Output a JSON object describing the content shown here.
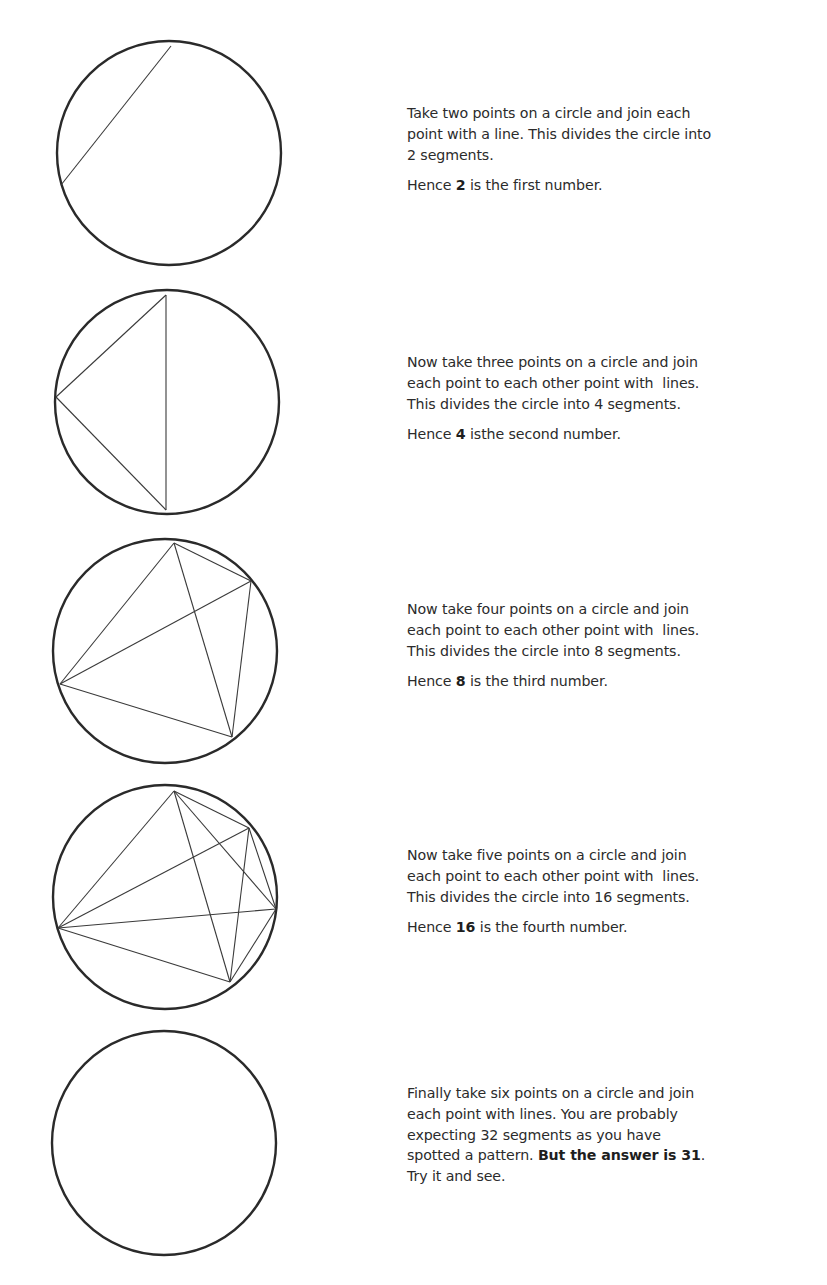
{
  "page": {
    "colors": {
      "text": "#2b2b2b",
      "stroke": "#2a2a2a",
      "background": "#ffffff"
    }
  },
  "figures": [
    {
      "points": 2,
      "segments": 2,
      "circle": {
        "cx": 169,
        "cy": 153,
        "r": 112
      },
      "chord_points": [
        [
          171,
          46
        ],
        [
          61,
          185
        ]
      ],
      "chords": [
        [
          0,
          1
        ]
      ],
      "caption": {
        "lines": [
          "Take two points on a circle and join each",
          "point with a line. This divides the circle into",
          "2 segments."
        ],
        "hence_prefix": "Hence ",
        "hence_number": "2",
        "hence_suffix": " is the first number."
      }
    },
    {
      "points": 3,
      "segments": 4,
      "circle": {
        "cx": 167,
        "cy": 402,
        "r": 112
      },
      "chord_points": [
        [
          166,
          295
        ],
        [
          56,
          397
        ],
        [
          166,
          510
        ]
      ],
      "chords": [
        [
          0,
          1
        ],
        [
          0,
          2
        ],
        [
          1,
          2
        ]
      ],
      "caption": {
        "lines": [
          "Now take three points on a circle and join",
          "each point to each other point with  lines.",
          "This divides the circle into 4 segments."
        ],
        "hence_prefix": "Hence ",
        "hence_number": "4",
        "hence_suffix": " isthe second number."
      }
    },
    {
      "points": 4,
      "segments": 8,
      "circle": {
        "cx": 165,
        "cy": 651,
        "r": 112
      },
      "chord_points": [
        [
          174,
          543
        ],
        [
          251,
          581
        ],
        [
          232,
          737
        ],
        [
          60,
          684
        ]
      ],
      "chords": [
        [
          0,
          1
        ],
        [
          0,
          2
        ],
        [
          0,
          3
        ],
        [
          1,
          2
        ],
        [
          1,
          3
        ],
        [
          2,
          3
        ]
      ],
      "caption": {
        "lines": [
          "Now take four points on a circle and join",
          "each point to each other point with  lines.",
          "This divides the circle into 8 segments."
        ],
        "hence_prefix": "Hence ",
        "hence_number": "8",
        "hence_suffix": " is the third number."
      }
    },
    {
      "points": 5,
      "segments": 16,
      "circle": {
        "cx": 165,
        "cy": 897,
        "r": 112
      },
      "chord_points": [
        [
          174,
          791
        ],
        [
          249,
          828
        ],
        [
          276,
          909
        ],
        [
          230,
          982
        ],
        [
          58,
          928
        ]
      ],
      "chords": [
        [
          0,
          1
        ],
        [
          0,
          2
        ],
        [
          0,
          3
        ],
        [
          0,
          4
        ],
        [
          1,
          2
        ],
        [
          1,
          3
        ],
        [
          1,
          4
        ],
        [
          2,
          3
        ],
        [
          2,
          4
        ],
        [
          3,
          4
        ]
      ],
      "caption": {
        "lines": [
          "Now take five points on a circle and join",
          "each point to each other point with  lines.",
          "This divides the circle into 16 segments."
        ],
        "hence_prefix": "Hence ",
        "hence_number": "16",
        "hence_suffix": " is the fourth number."
      }
    },
    {
      "points": 6,
      "segments": 31,
      "expected_segments": 32,
      "circle": {
        "cx": 164,
        "cy": 1143,
        "r": 112
      },
      "chord_points": [],
      "chords": [],
      "caption": {
        "lines": [
          "Finally take six points on a circle and join",
          "each point with lines. You are probably",
          "expecting 32 segments as you have"
        ],
        "line4_prefix": "spotted a pattern. ",
        "line4_bold": "But the answer is 31",
        "line4_suffix": ".",
        "line5": "Try it and see."
      }
    }
  ]
}
